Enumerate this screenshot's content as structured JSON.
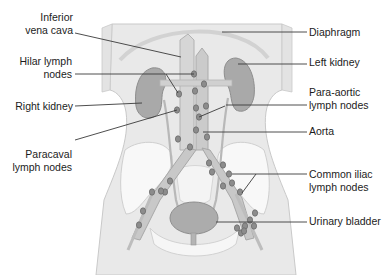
{
  "figure": {
    "colors": {
      "body_fill": "#e6e6e6",
      "body_stroke": "#c4c4c4",
      "organ_fill": "#a8a8a8",
      "organ_stroke": "#8c8c8c",
      "vessel_fill": "#cfcfcf",
      "vessel_stroke": "#b0b0b0",
      "node_fill": "#8a8a8a",
      "node_stroke": "#6e6e6e",
      "bone_fill": "#f7f7f7",
      "leader_line": "#3a3a3a"
    },
    "labels_left": [
      {
        "id": "inferior-vena-cava",
        "text": "Inferior\nvena cava",
        "x": 0,
        "y": 11,
        "w": 73
      },
      {
        "id": "hilar-lymph-nodes",
        "text": "Hilar lymph\nnodes",
        "x": 0,
        "y": 55,
        "w": 72
      },
      {
        "id": "right-kidney",
        "text": "Right kidney",
        "x": 0,
        "y": 100,
        "w": 73
      },
      {
        "id": "paracaval-lymph-nodes",
        "text": "Paracaval\nlymph nodes",
        "x": 0,
        "y": 148,
        "w": 72
      }
    ],
    "labels_right": [
      {
        "id": "diaphragm",
        "text": "Diaphragm",
        "x": 309,
        "y": 25
      },
      {
        "id": "left-kidney",
        "text": "Left kidney",
        "x": 309,
        "y": 55
      },
      {
        "id": "para-aortic-lymph-nodes",
        "text": "Para-aortic\nlymph nodes",
        "x": 309,
        "y": 86
      },
      {
        "id": "aorta",
        "text": "Aorta",
        "x": 309,
        "y": 125
      },
      {
        "id": "common-iliac-lymph-nodes",
        "text": "Common iliac\nlymph nodes",
        "x": 309,
        "y": 168
      },
      {
        "id": "urinary-bladder",
        "text": "Urinary bladder",
        "x": 309,
        "y": 205
      }
    ],
    "leaders": [
      {
        "id": "ivc",
        "x1": 75,
        "y1": 33,
        "x2": 181,
        "y2": 57
      },
      {
        "id": "hilar",
        "x1": 75,
        "y1": 74,
        "x2": 194,
        "y2": 74
      },
      {
        "id": "hilar-2",
        "x1": 166,
        "y1": 74,
        "x2": 178,
        "y2": 93
      },
      {
        "id": "right-kidney",
        "x1": 75,
        "y1": 106,
        "x2": 142,
        "y2": 103
      },
      {
        "id": "paracaval",
        "x1": 75,
        "y1": 140,
        "x2": 177,
        "y2": 110
      },
      {
        "id": "diaphragm",
        "x1": 222,
        "y1": 32,
        "x2": 307,
        "y2": 32
      },
      {
        "id": "left-kidney",
        "x1": 238,
        "y1": 64,
        "x2": 307,
        "y2": 64
      },
      {
        "id": "para-aortic",
        "x1": 226,
        "y1": 105,
        "x2": 307,
        "y2": 105
      },
      {
        "id": "para-aortic-2",
        "x1": 225,
        "y1": 106,
        "x2": 199,
        "y2": 117
      },
      {
        "id": "aorta",
        "x1": 203,
        "y1": 132,
        "x2": 307,
        "y2": 132
      },
      {
        "id": "common-iliac",
        "x1": 232,
        "y1": 174,
        "x2": 307,
        "y2": 174
      },
      {
        "id": "common-iliac-2",
        "x1": 256,
        "y1": 174,
        "x2": 242,
        "y2": 193
      },
      {
        "id": "urinary-bladder",
        "x1": 216,
        "y1": 222,
        "x2": 307,
        "y2": 222
      }
    ]
  }
}
